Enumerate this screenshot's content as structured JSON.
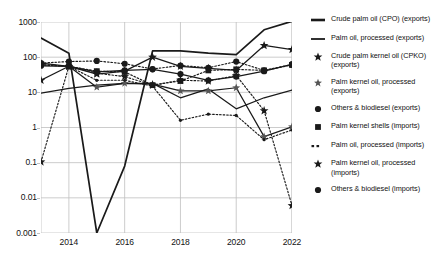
{
  "chart_data": {
    "type": "line",
    "title": "",
    "xlabel": "",
    "ylabel": "",
    "x": [
      2013,
      2014,
      2015,
      2016,
      2017,
      2018,
      2019,
      2020,
      2021,
      2022
    ],
    "x_tick_labels": [
      "2014",
      "2016",
      "2018",
      "2020",
      "2022"
    ],
    "x_ticks": [
      2014,
      2016,
      2018,
      2020,
      2022
    ],
    "xlim": [
      2013,
      2022
    ],
    "y_scale": "log",
    "ylim": [
      0.001,
      1000
    ],
    "y_ticks": [
      1000,
      100,
      10,
      1,
      0.1,
      0.01,
      0.001
    ],
    "y_tick_labels": [
      "1000",
      "100",
      "10",
      "1",
      "0.1",
      "0.01",
      "0.001"
    ],
    "grid": true,
    "legend_position": "right",
    "series": [
      {
        "name": "Crude palm oil (CPO) (exports)",
        "style": "solid-thick",
        "marker": "none",
        "values": [
          350,
          130,
          0.001,
          0.08,
          150,
          150,
          130,
          118,
          600,
          1050
        ]
      },
      {
        "name": "Palm oil, processed (exports)",
        "style": "solid",
        "marker": "none",
        "values": [
          9.5,
          13,
          16,
          18,
          18,
          7,
          12.5,
          3.4,
          7,
          11.5
        ]
      },
      {
        "name": "Crude palm kernel oil (CPKO) (exports)",
        "style": "solid",
        "marker": "star-bold",
        "values": [
          22,
          55,
          33,
          40,
          100,
          55,
          48,
          42,
          215,
          165
        ]
      },
      {
        "name": "Palm kernel oil, processed (exports)",
        "style": "solid",
        "marker": "star-light",
        "values": [
          68,
          55,
          14,
          18,
          17,
          11,
          11,
          13.5,
          0.55,
          1.05
        ]
      },
      {
        "name": "Others & biodiesel (exports)",
        "style": "solid",
        "marker": "circle",
        "values": [
          57,
          55,
          38,
          42,
          45,
          33,
          22,
          28,
          40,
          62
        ]
      },
      {
        "name": "Palm kernel shells (imports)",
        "style": "dotted",
        "marker": "square",
        "values": [
          62,
          55,
          40,
          38,
          16,
          21,
          42,
          45,
          42,
          60
        ]
      },
      {
        "name": "Palm oil, processed (imports)",
        "style": "dotted",
        "marker": "circle",
        "values": [
          68,
          75,
          78,
          65,
          46,
          58,
          50,
          75,
          42,
          62
        ]
      },
      {
        "name": "Palm kernel oil, processed (imports)",
        "style": "dotted",
        "marker": "star-bold",
        "values": [
          0.105,
          55,
          35,
          28,
          16,
          22,
          21,
          30,
          3.0,
          0.006
        ]
      },
      {
        "name": "Others & biodiesel (imports)",
        "style": "dotted",
        "marker": "circle-small",
        "values": [
          60,
          55,
          22,
          22,
          15,
          1.6,
          2.4,
          2.2,
          0.45,
          0.85
        ]
      }
    ],
    "legend": [
      {
        "label": "Crude palm oil (CPO) (exports)",
        "marker": "line-thick"
      },
      {
        "label": "Palm oil, processed (exports)",
        "marker": "line-thin"
      },
      {
        "label": "Crude palm kernel oil (CPKO) (exports)",
        "marker": "star-bold"
      },
      {
        "label": "Palm kernel oil, processed (exports)",
        "marker": "star-light"
      },
      {
        "label": "Others & biodiesel (exports)",
        "marker": "circle"
      },
      {
        "label": "Palm kernel shells (imports)",
        "marker": "square"
      },
      {
        "label": "Palm oil, processed (imports)",
        "marker": "dotted-dashes"
      },
      {
        "label": "Palm kernel oil, processed (imports)",
        "marker": "star-bold"
      },
      {
        "label": "Others & biodiesel (imports)",
        "marker": "circle"
      }
    ],
    "colors": {
      "line": "#1a1a1a",
      "grid": "#bfbfbf",
      "text": "#111111",
      "background": "#ffffff"
    }
  }
}
